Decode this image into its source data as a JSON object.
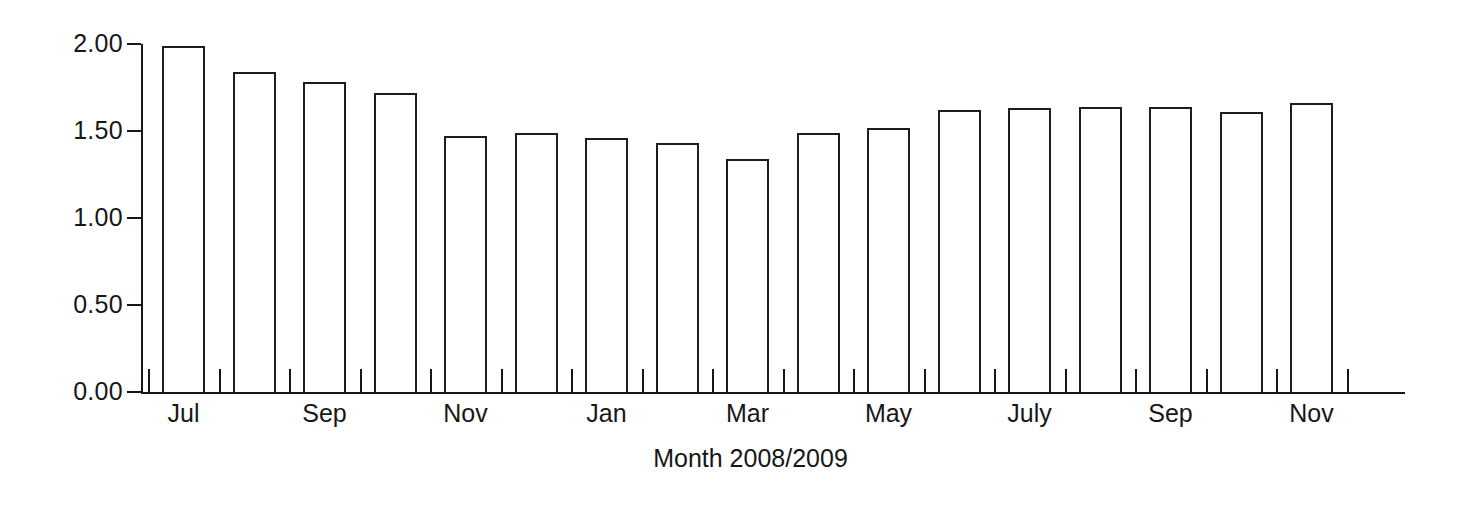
{
  "chart_data": {
    "type": "bar",
    "title": "",
    "subtitle": "",
    "xlabel": "Month 2008/2009",
    "ylabel": "",
    "ylim": [
      0.0,
      2.0
    ],
    "yticks": [
      0.0,
      0.5,
      1.0,
      1.5,
      2.0
    ],
    "ytick_labels": [
      "0.00",
      "0.50",
      "1.00",
      "1.50",
      "2.00"
    ],
    "grid": false,
    "legend": null,
    "bar_style": {
      "fill": "#ffffff",
      "edge": "#1d1d1d",
      "edge_width": 2
    },
    "categories": [
      "Jul",
      "Aug",
      "Sep",
      "Oct",
      "Nov",
      "Dec",
      "Jan",
      "Feb",
      "Mar",
      "Apr",
      "May",
      "Jun",
      "July",
      "Aug",
      "Sep",
      "Oct",
      "Nov"
    ],
    "xtick_labels": [
      "Jul",
      "",
      "Sep",
      "",
      "Nov",
      "",
      "Jan",
      "",
      "Mar",
      "",
      "May",
      "",
      "July",
      "",
      "Sep",
      "",
      "Nov"
    ],
    "values": [
      1.99,
      1.84,
      1.78,
      1.72,
      1.47,
      1.49,
      1.46,
      1.43,
      1.34,
      1.49,
      1.52,
      1.62,
      1.63,
      1.64,
      1.64,
      1.61,
      1.66
    ]
  }
}
